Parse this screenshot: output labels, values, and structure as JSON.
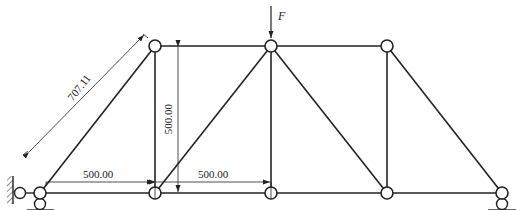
{
  "diagram": {
    "type": "plane-truss",
    "nodes": {
      "bottom": [
        {
          "id": "B1",
          "x": 40,
          "y": 193
        },
        {
          "id": "B2",
          "x": 155,
          "y": 193
        },
        {
          "id": "B3",
          "x": 271,
          "y": 193
        },
        {
          "id": "B4",
          "x": 387,
          "y": 193
        },
        {
          "id": "B5",
          "x": 502,
          "y": 193
        }
      ],
      "top": [
        {
          "id": "T1",
          "x": 155,
          "y": 46
        },
        {
          "id": "T2",
          "x": 271,
          "y": 46
        },
        {
          "id": "T3",
          "x": 387,
          "y": 46
        }
      ]
    },
    "members": [
      [
        "B1",
        "B2"
      ],
      [
        "B2",
        "B3"
      ],
      [
        "B3",
        "B4"
      ],
      [
        "B4",
        "B5"
      ],
      [
        "T1",
        "T2"
      ],
      [
        "T2",
        "T3"
      ],
      [
        "B1",
        "T1"
      ],
      [
        "B2",
        "T1"
      ],
      [
        "B2",
        "T2"
      ],
      [
        "B3",
        "T2"
      ],
      [
        "T2",
        "B4"
      ],
      [
        "B4",
        "T3"
      ],
      [
        "T3",
        "B5"
      ]
    ],
    "load": {
      "label": "F",
      "node": "T2",
      "direction": "down"
    },
    "dimensions": {
      "diagonal": "707.11",
      "height": "500.00",
      "span1": "500.00",
      "span2": "500.00"
    },
    "supports": {
      "left": "pinned (horizontal link to wall + vertical link to ground)",
      "right": "roller (vertical link to ground)"
    }
  }
}
